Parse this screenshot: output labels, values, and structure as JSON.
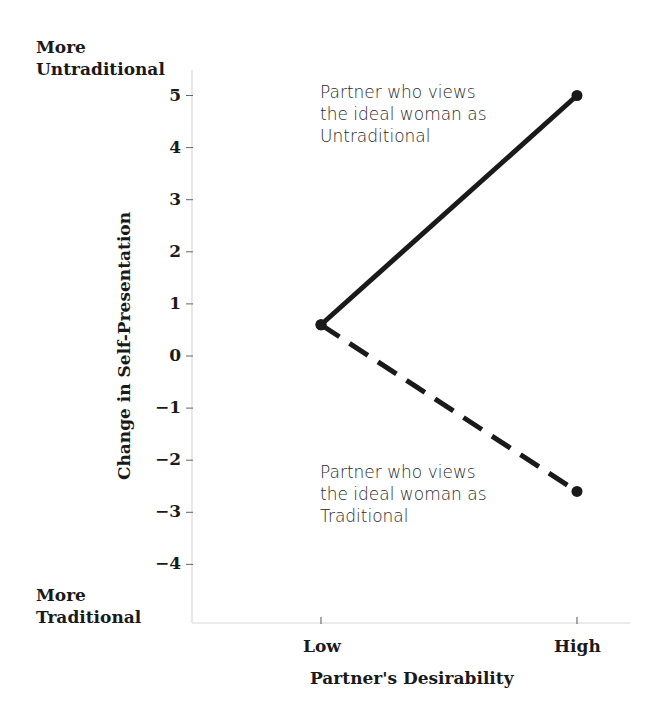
{
  "chart_data": {
    "type": "line",
    "title": "",
    "xlabel": "Partner's Desirability",
    "ylabel": "Change in Self-Presentation",
    "categories": [
      "Low",
      "High"
    ],
    "x": [
      "Low",
      "High"
    ],
    "series": [
      {
        "name": "Partner who views the ideal woman as Untraditional",
        "style": "solid",
        "values": [
          0.6,
          5.0
        ]
      },
      {
        "name": "Partner who views the ideal woman as Traditional",
        "style": "dashed",
        "values": [
          0.6,
          -2.6
        ]
      }
    ],
    "yticks": [
      5,
      4,
      3,
      2,
      1,
      0,
      -1,
      -2,
      -3,
      -4
    ],
    "ytick_labels": [
      "5",
      "4",
      "3",
      "2",
      "1",
      "0",
      "−1",
      "−2",
      "−3",
      "−4"
    ],
    "ylim": [
      -5.1,
      5.5
    ],
    "grid": false,
    "legend": "inline annotations",
    "y_end_labels": {
      "top": [
        "More",
        "Untraditional"
      ],
      "bottom": [
        "More",
        "Traditional"
      ]
    },
    "annotations": [
      {
        "text_lines": [
          "Partner who views",
          "the ideal woman as",
          "Untraditional"
        ],
        "series": 0
      },
      {
        "text_lines": [
          "Partner who views",
          "the ideal woman as",
          "Traditional"
        ],
        "series": 1
      }
    ]
  },
  "colors": {
    "line": "#1a1a1a",
    "axis": "#d8d8d8",
    "text": "#1a1a1a"
  }
}
